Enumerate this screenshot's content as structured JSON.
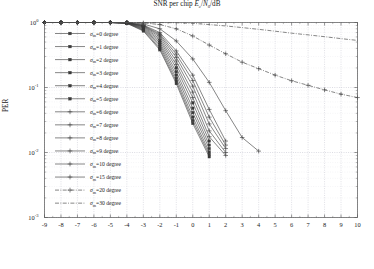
{
  "figure": {
    "ylabel": "PER",
    "xlabel_plain": "SNR per chip Ec/N0/dB",
    "xlabel_pre": "SNR per chip ",
    "xlabel_e": "E",
    "xlabel_c": "c",
    "xlabel_slash": "/",
    "xlabel_n": "N",
    "xlabel_0": "0",
    "xlabel_db": "/dB",
    "background": "#ffffff",
    "grid_color": "#b9b9c6",
    "axis_color": "#555555",
    "curve_color": "#3a3a3a"
  },
  "xaxis": {
    "min": -9,
    "max": 10,
    "ticks": [
      "-9",
      "-8",
      "-7",
      "-6",
      "-5",
      "-4",
      "-3",
      "-2",
      "-1",
      "0",
      "1",
      "2",
      "3",
      "4",
      "5",
      "6",
      "7",
      "8",
      "9",
      "10"
    ]
  },
  "yaxis": {
    "min_exp": -3,
    "max_exp": 0,
    "ticks": [
      {
        "base": "10",
        "exp": "0"
      },
      {
        "base": "10",
        "exp": "-1"
      },
      {
        "base": "10",
        "exp": "-2"
      },
      {
        "base": "10",
        "exp": "-3"
      }
    ]
  },
  "legend": {
    "sigma_symbol": "σ",
    "sigma_sub": "m",
    "items": [
      {
        "label": "=0 degree",
        "value": 0,
        "marker": "square",
        "style": "solid"
      },
      {
        "label": "=1 degree",
        "value": 1,
        "marker": "square",
        "style": "solid"
      },
      {
        "label": "=2 degree",
        "value": 2,
        "marker": "square",
        "style": "solid"
      },
      {
        "label": "=3 degree",
        "value": 3,
        "marker": "square",
        "style": "solid"
      },
      {
        "label": "=4 degree",
        "value": 4,
        "marker": "square",
        "style": "solid"
      },
      {
        "label": "=5 degree",
        "value": 5,
        "marker": "square",
        "style": "solid"
      },
      {
        "label": "=6 degree",
        "value": 6,
        "marker": "plus",
        "style": "solid"
      },
      {
        "label": "=7 degree",
        "value": 7,
        "marker": "plus",
        "style": "solid"
      },
      {
        "label": "=8 degree",
        "value": 8,
        "marker": "plus",
        "style": "solid"
      },
      {
        "label": "=9 degree",
        "value": 9,
        "marker": "plus",
        "style": "solid"
      },
      {
        "label": "=10 degree",
        "value": 10,
        "marker": "plus",
        "style": "solid"
      },
      {
        "label": "=15 degree",
        "value": 15,
        "marker": "plus",
        "style": "solid"
      },
      {
        "label": "=20 degree",
        "value": 20,
        "marker": "plus",
        "style": "dashdot"
      },
      {
        "label": "=30 degree",
        "value": 30,
        "marker": "none",
        "style": "dashdot"
      }
    ]
  },
  "chart_data": {
    "type": "line",
    "title": "",
    "xlabel": "SNR per chip Ec/N0/dB",
    "ylabel": "PER",
    "xlim": [
      -9,
      10
    ],
    "ylim": [
      0.001,
      1
    ],
    "yscale": "log",
    "grid": true,
    "legend_position": "left-inside",
    "x": [
      -9,
      -8,
      -7,
      -6,
      -5,
      -4,
      -3,
      -2,
      -1,
      0,
      1,
      2,
      3,
      4,
      5,
      6,
      7,
      8,
      9,
      10
    ],
    "series": [
      {
        "name": "σm=0 degree",
        "values": [
          1,
          1,
          1,
          1,
          1,
          0.97,
          0.74,
          0.38,
          0.115,
          0.028,
          0.0086,
          null,
          null,
          null,
          null,
          null,
          null,
          null,
          null,
          null
        ]
      },
      {
        "name": "σm=1 degree",
        "values": [
          1,
          1,
          1,
          1,
          1,
          0.975,
          0.76,
          0.4,
          0.125,
          0.031,
          0.0093,
          null,
          null,
          null,
          null,
          null,
          null,
          null,
          null,
          null
        ]
      },
      {
        "name": "σm=2 degree",
        "values": [
          1,
          1,
          1,
          1,
          1,
          0.98,
          0.78,
          0.43,
          0.138,
          0.035,
          0.0102,
          null,
          null,
          null,
          null,
          null,
          null,
          null,
          null,
          null
        ]
      },
      {
        "name": "σm=3 degree",
        "values": [
          1,
          1,
          1,
          1,
          1,
          0.985,
          0.8,
          0.46,
          0.155,
          0.041,
          0.0115,
          null,
          null,
          null,
          null,
          null,
          null,
          null,
          null,
          null
        ]
      },
      {
        "name": "σm=4 degree",
        "values": [
          1,
          1,
          1,
          1,
          1,
          0.985,
          0.82,
          0.49,
          0.175,
          0.048,
          0.013,
          null,
          null,
          null,
          null,
          null,
          null,
          null,
          null,
          null
        ]
      },
      {
        "name": "σm=5 degree",
        "values": [
          1,
          1,
          1,
          1,
          1,
          0.99,
          0.84,
          0.525,
          0.2,
          0.058,
          0.015,
          null,
          null,
          null,
          null,
          null,
          null,
          null,
          null,
          null
        ]
      },
      {
        "name": "σm=6 degree",
        "values": [
          1,
          1,
          1,
          1,
          1,
          0.99,
          0.86,
          0.56,
          0.225,
          0.07,
          0.0175,
          0.009,
          null,
          null,
          null,
          null,
          null,
          null,
          null,
          null
        ]
      },
      {
        "name": "σm=7 degree",
        "values": [
          1,
          1,
          1,
          1,
          1,
          0.992,
          0.875,
          0.6,
          0.255,
          0.085,
          0.0215,
          0.01,
          null,
          null,
          null,
          null,
          null,
          null,
          null,
          null
        ]
      },
      {
        "name": "σm=8 degree",
        "values": [
          1,
          1,
          1,
          1,
          1,
          0.993,
          0.89,
          0.635,
          0.29,
          0.105,
          0.0275,
          0.0115,
          null,
          null,
          null,
          null,
          null,
          null,
          null,
          null
        ]
      },
      {
        "name": "σm=9 degree",
        "values": [
          1,
          1,
          1,
          1,
          1,
          0.994,
          0.9,
          0.665,
          0.325,
          0.128,
          0.035,
          0.013,
          null,
          null,
          null,
          null,
          null,
          null,
          null,
          null
        ]
      },
      {
        "name": "σm=10 degree",
        "values": [
          1,
          1,
          1,
          1,
          1,
          0.995,
          0.915,
          0.7,
          0.365,
          0.155,
          0.046,
          0.015,
          null,
          null,
          null,
          null,
          null,
          null,
          null,
          null
        ]
      },
      {
        "name": "σm=15 degree",
        "values": [
          1,
          1,
          1,
          1,
          1,
          0.998,
          0.95,
          0.8,
          0.52,
          0.275,
          0.12,
          0.044,
          0.017,
          0.0105,
          null,
          null,
          null,
          null,
          null,
          null
        ]
      },
      {
        "name": "σm=20 degree",
        "values": [
          1,
          1,
          1,
          1,
          1,
          0.999,
          0.985,
          0.93,
          0.8,
          0.62,
          0.45,
          0.33,
          0.245,
          0.195,
          0.155,
          0.127,
          0.108,
          0.092,
          0.079,
          0.07
        ]
      },
      {
        "name": "σm=30 degree",
        "values": [
          1,
          1,
          1,
          1,
          1,
          1,
          1,
          0.998,
          0.99,
          0.97,
          0.93,
          0.885,
          0.835,
          0.785,
          0.735,
          0.685,
          0.645,
          0.605,
          0.565,
          0.53
        ]
      }
    ]
  }
}
